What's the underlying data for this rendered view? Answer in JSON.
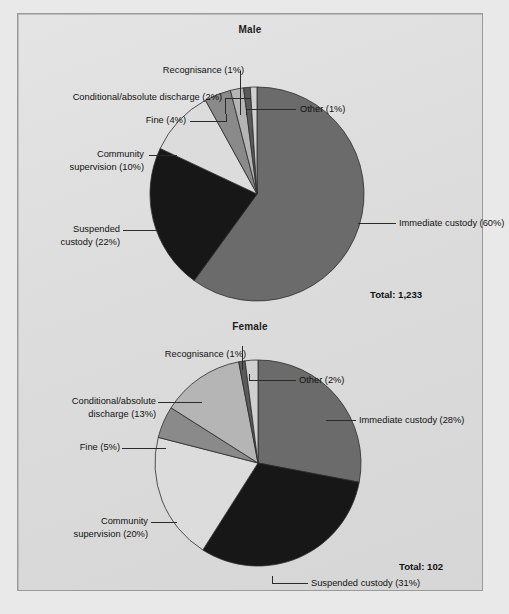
{
  "figure": {
    "background": "#dedede",
    "border_color": "#9a9a9a"
  },
  "palette": {
    "immediate_custody": "#6b6b6b",
    "suspended_custody": "#171717",
    "community_supervision": "#dcdcdc",
    "fine": "#8a8a8a",
    "conditional_absolute_discharge": "#b5b5b5",
    "recognisance": "#5a5a5a",
    "other": "#d0d0d0",
    "outline": "#2b2b2b",
    "text": "#111111"
  },
  "chart_data": [
    {
      "type": "pie",
      "title": "Male",
      "total_label": "Total: 1,233",
      "total_value": 1233,
      "categories": [
        "Immediate custody",
        "Suspended custody",
        "Community supervision",
        "Fine",
        "Conditional/absolute discharge",
        "Recognisance",
        "Other"
      ],
      "values": [
        60,
        22,
        10,
        4,
        2,
        1,
        1
      ],
      "labels": [
        "Immediate custody (60%)",
        "Suspended custody (22%)",
        "Community supervision (10%)",
        "Fine (4%)",
        "Conditional/absolute discharge (2%)",
        "Recognisance (1%)",
        "Other (1%)"
      ],
      "legend": "callout-labels",
      "start_angle_deg": 0
    },
    {
      "type": "pie",
      "title": "Female",
      "total_label": "Total: 102",
      "total_value": 102,
      "categories": [
        "Immediate custody",
        "Suspended custody",
        "Community supervision",
        "Fine",
        "Conditional/absolute discharge",
        "Recognisance",
        "Other"
      ],
      "values": [
        28,
        31,
        20,
        5,
        13,
        1,
        2
      ],
      "labels": [
        "Immediate custody (28%)",
        "Suspended custody (31%)",
        "Community supervision (20%)",
        "Fine (5%)",
        "Conditional/absolute discharge (13%)",
        "Recognisance (1%)",
        "Other (2%)"
      ],
      "legend": "callout-labels",
      "start_angle_deg": 0
    }
  ],
  "male": {
    "title": "Male",
    "total": "Total: 1,233",
    "labels": {
      "recognisance": "Recognisance (1%)",
      "conditional": "Conditional/absolute discharge (2%)",
      "fine": "Fine (4%)",
      "community_line1": "Community",
      "community_line2": "supervision (10%)",
      "suspended_line1": "Suspended",
      "suspended_line2": "custody (22%)",
      "other": "Other (1%)",
      "immediate": "Immediate custody (60%)"
    }
  },
  "female": {
    "title": "Female",
    "total": "Total: 102",
    "labels": {
      "recognisance": "Recognisance (1%)",
      "other": "Other (2%)",
      "conditional_line1": "Conditional/absolute",
      "conditional_line2": "discharge (13%)",
      "fine": "Fine (5%)",
      "community_line1": "Community",
      "community_line2": "supervision (20%)",
      "immediate": "Immediate custody (28%)",
      "suspended": "Suspended custody (31%)"
    }
  }
}
